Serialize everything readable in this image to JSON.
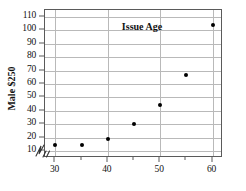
{
  "chart_data": {
    "type": "scatter",
    "title": "",
    "xlabel": "Issue Age",
    "ylabel": "Male $250",
    "x": [
      30,
      35,
      40,
      45,
      50,
      55,
      60
    ],
    "values": [
      14.5,
      14.5,
      19,
      30.5,
      44.5,
      67,
      104
    ],
    "points": [
      {
        "x": 30,
        "y": 14.5
      },
      {
        "x": 35,
        "y": 14.5
      },
      {
        "x": 40,
        "y": 19
      },
      {
        "x": 45,
        "y": 30.5
      },
      {
        "x": 50,
        "y": 44.5
      },
      {
        "x": 55,
        "y": 67
      },
      {
        "x": 60,
        "y": 104
      }
    ],
    "xlim": [
      28,
      62
    ],
    "ylim": [
      5,
      115
    ],
    "xticks": [
      30,
      35,
      40,
      45,
      50,
      55,
      60
    ],
    "xtick_labels": [
      "30",
      "",
      "40",
      "",
      "50",
      "",
      "60"
    ],
    "yticks": [
      10,
      20,
      30,
      40,
      50,
      60,
      70,
      80,
      90,
      100,
      110
    ],
    "ytick_labels": [
      "10",
      "20",
      "30",
      "40",
      "50",
      "60",
      "70",
      "80",
      "90",
      "100",
      "110"
    ],
    "grid": true,
    "grid_color": "#b9b9b9",
    "axis_color": "#5a5a5a",
    "marker_color": "#000000",
    "legend": null,
    "axis_break": "y-axis-break-symbol"
  },
  "axes": {
    "x_title": "Issue Age",
    "y_title": "Male $250"
  }
}
